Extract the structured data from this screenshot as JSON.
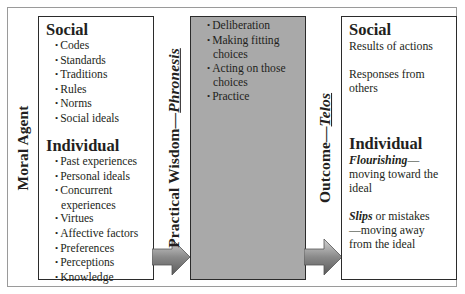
{
  "diagram": {
    "labels": {
      "moral_agent": "Moral Agent",
      "practical_wisdom": "Practical Wisdom",
      "practical_wisdom_dash": "—",
      "practical_wisdom_term": "Phronesis",
      "outcome": "Outcome",
      "outcome_dash": "—",
      "outcome_term": "Telos"
    },
    "moral_agent_box": {
      "social_heading": "Social",
      "social_items": [
        "Codes",
        "Standards",
        "Traditions",
        "Rules",
        "Norms",
        "Social ideals"
      ],
      "individual_heading": "Individual",
      "individual_items": [
        "Past experiences",
        "Personal ideals",
        "Concurrent experiences",
        "Virtues",
        "Affective factors",
        "Preferences",
        "Perceptions",
        "Knowledge"
      ]
    },
    "practical_wisdom_box": {
      "items": [
        "Deliberation",
        "Making fitting choices",
        "Acting on those choices",
        "Practice"
      ],
      "fill_color": "#a9a9a9"
    },
    "outcome_box": {
      "social_heading": "Social",
      "social_lines": [
        "Results of actions",
        "Responses from others"
      ],
      "individual_heading": "Individual",
      "flourishing_term": "Flourishing",
      "flourishing_text": "—moving toward the ideal",
      "slips_term": "Slips",
      "slips_text": " or mistakes—moving away from the ideal"
    },
    "arrows": [
      {
        "from": "Moral Agent",
        "to": "Practical Wisdom"
      },
      {
        "from": "Practical Wisdom",
        "to": "Outcome"
      }
    ]
  }
}
